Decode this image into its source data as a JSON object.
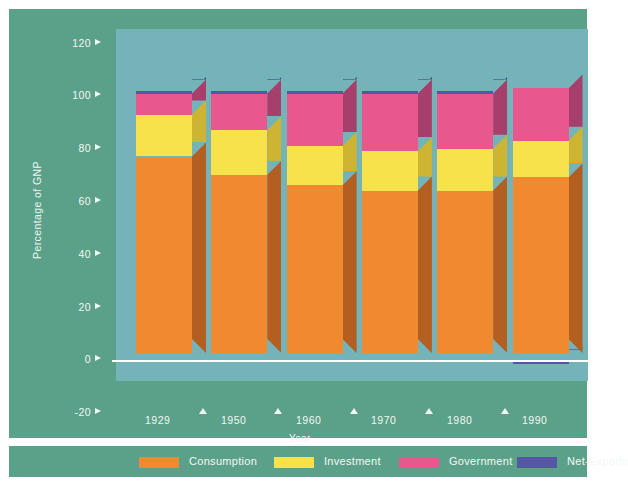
{
  "chart_data": {
    "type": "bar",
    "subtype": "stacked-3d",
    "title": "",
    "xlabel": "Year",
    "ylabel": "Percentage of GNP",
    "categories": [
      "1929",
      "1950",
      "1960",
      "1970",
      "1980",
      "1990"
    ],
    "ylim": [
      -30,
      125
    ],
    "yticks": [
      120,
      100,
      80,
      60,
      40,
      20,
      0,
      -20
    ],
    "ytick_labels": [
      "120",
      "100",
      "80",
      "60",
      "40",
      "20",
      "0",
      "-20"
    ],
    "grid": false,
    "legend_position": "bottom",
    "series": [
      {
        "name": "Consumption",
        "color": "#f08a31",
        "side_color": "#b35f22",
        "values": [
          75,
          68,
          64,
          62,
          62,
          67
        ]
      },
      {
        "name": "Investment",
        "color": "#f7e24b",
        "side_color": "#cdb432",
        "values": [
          16,
          17,
          15,
          15,
          16,
          14
        ]
      },
      {
        "name": "Government",
        "color": "#e8588f",
        "side_color": "#a63f6b",
        "values": [
          8,
          14,
          20,
          22,
          21,
          20
        ]
      },
      {
        "name": "Net-Exports",
        "color": "#5457a6",
        "side_color": "#3c3d78",
        "values": [
          1,
          1,
          1,
          1,
          1,
          -1
        ]
      }
    ]
  },
  "axis": {
    "y_label": "Percentage of GNP",
    "x_label": "Year"
  },
  "legend": {
    "items": [
      {
        "label": "Consumption",
        "color": "#f08a31"
      },
      {
        "label": "Investment",
        "color": "#f7e24b"
      },
      {
        "label": "Government",
        "color": "#e8588f"
      },
      {
        "label": "Net-Exports",
        "color": "#5457a6"
      }
    ]
  },
  "colors": {
    "panel_background": "#5ba189",
    "plot_background": "#74b3b8",
    "axis_text": "#f2f7f3",
    "zero_line": "#ffffff"
  }
}
